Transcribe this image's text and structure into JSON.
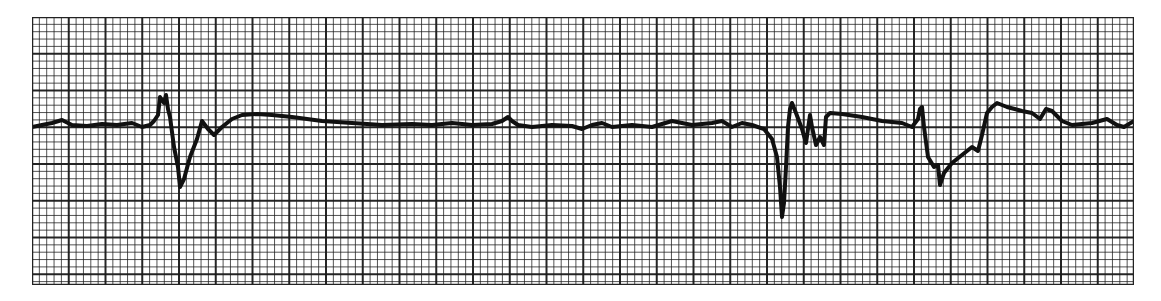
{
  "figure": {
    "type": "ecg-strip",
    "grid": {
      "small_box_px": 7.35,
      "large_box_every": 5,
      "line_color": "#1a1a1a",
      "paper_color": "#ffffff"
    },
    "trace": {
      "color": "#111111",
      "baseline_y": 108,
      "points": [
        [
          0,
          110
        ],
        [
          10,
          108
        ],
        [
          20,
          106
        ],
        [
          30,
          103
        ],
        [
          40,
          108
        ],
        [
          55,
          109
        ],
        [
          70,
          107
        ],
        [
          85,
          108
        ],
        [
          100,
          106
        ],
        [
          110,
          110
        ],
        [
          118,
          108
        ],
        [
          122,
          104
        ],
        [
          126,
          98
        ],
        [
          128,
          80
        ],
        [
          132,
          86
        ],
        [
          134,
          78
        ],
        [
          136,
          92
        ],
        [
          138,
          100
        ],
        [
          142,
          130
        ],
        [
          146,
          150
        ],
        [
          148,
          170
        ],
        [
          152,
          162
        ],
        [
          158,
          140
        ],
        [
          165,
          122
        ],
        [
          170,
          104
        ],
        [
          176,
          112
        ],
        [
          182,
          118
        ],
        [
          190,
          110
        ],
        [
          200,
          102
        ],
        [
          210,
          98
        ],
        [
          225,
          97
        ],
        [
          240,
          98
        ],
        [
          260,
          100
        ],
        [
          290,
          104
        ],
        [
          320,
          106
        ],
        [
          350,
          108
        ],
        [
          380,
          107
        ],
        [
          400,
          108
        ],
        [
          420,
          106
        ],
        [
          440,
          108
        ],
        [
          460,
          107
        ],
        [
          470,
          104
        ],
        [
          476,
          100
        ],
        [
          480,
          104
        ],
        [
          486,
          108
        ],
        [
          500,
          110
        ],
        [
          520,
          108
        ],
        [
          540,
          109
        ],
        [
          550,
          112
        ],
        [
          560,
          108
        ],
        [
          570,
          106
        ],
        [
          580,
          110
        ],
        [
          600,
          108
        ],
        [
          620,
          110
        ],
        [
          640,
          104
        ],
        [
          660,
          108
        ],
        [
          680,
          106
        ],
        [
          690,
          104
        ],
        [
          700,
          110
        ],
        [
          710,
          106
        ],
        [
          720,
          108
        ],
        [
          732,
          112
        ],
        [
          740,
          122
        ],
        [
          745,
          140
        ],
        [
          748,
          170
        ],
        [
          750,
          200
        ],
        [
          752,
          186
        ],
        [
          754,
          150
        ],
        [
          756,
          110
        ],
        [
          758,
          92
        ],
        [
          760,
          86
        ],
        [
          764,
          96
        ],
        [
          770,
          112
        ],
        [
          774,
          126
        ],
        [
          778,
          98
        ],
        [
          780,
          110
        ],
        [
          784,
          128
        ],
        [
          788,
          120
        ],
        [
          792,
          128
        ],
        [
          794,
          100
        ],
        [
          798,
          96
        ],
        [
          810,
          97
        ],
        [
          830,
          100
        ],
        [
          850,
          104
        ],
        [
          870,
          106
        ],
        [
          880,
          110
        ],
        [
          886,
          102
        ],
        [
          888,
          92
        ],
        [
          890,
          90
        ],
        [
          892,
          110
        ],
        [
          896,
          140
        ],
        [
          902,
          150
        ],
        [
          906,
          148
        ],
        [
          908,
          168
        ],
        [
          912,
          156
        ],
        [
          920,
          146
        ],
        [
          930,
          138
        ],
        [
          940,
          130
        ],
        [
          946,
          134
        ],
        [
          950,
          118
        ],
        [
          955,
          96
        ],
        [
          960,
          90
        ],
        [
          965,
          86
        ],
        [
          975,
          90
        ],
        [
          990,
          94
        ],
        [
          1000,
          96
        ],
        [
          1008,
          102
        ],
        [
          1014,
          92
        ],
        [
          1020,
          94
        ],
        [
          1030,
          104
        ],
        [
          1040,
          108
        ],
        [
          1060,
          106
        ],
        [
          1075,
          102
        ],
        [
          1085,
          108
        ],
        [
          1092,
          110
        ],
        [
          1102,
          104
        ]
      ]
    }
  }
}
